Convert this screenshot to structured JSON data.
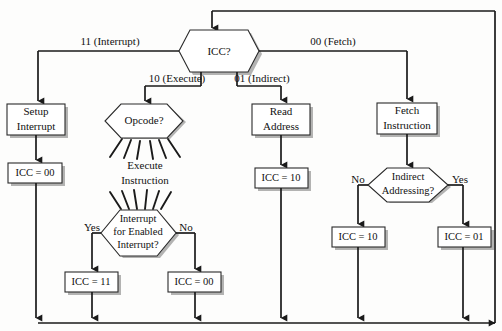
{
  "diagram": {
    "type": "flowchart"
  },
  "decisions": {
    "icc": {
      "label": "ICC?",
      "cx": 212,
      "cy": 51
    },
    "opcode": {
      "label": "Opcode?",
      "cx": 145,
      "cy": 122
    },
    "interrupt_check": {
      "line1": "Interrupt",
      "line2": "for Enabled",
      "line3": "Interrupt?",
      "cx": 140,
      "cy": 232
    },
    "indirect_check": {
      "line1": "Indirect",
      "line2": "Addressing?",
      "cx": 407,
      "cy": 184
    }
  },
  "processes": {
    "setup_interrupt": {
      "line1": "Setup",
      "line2": "Interrupt"
    },
    "read_address": {
      "line1": "Read",
      "line2": "Address"
    },
    "fetch_instruction": {
      "line1": "Fetch",
      "line2": "Instruction"
    },
    "execute_instruction": {
      "line1": "Execute",
      "line2": "Instruction"
    }
  },
  "states": {
    "icc_00_interrupt_branch": "ICC = 00",
    "icc_10_indirect_branch": "ICC = 10",
    "icc_11_execute_yes": "ICC = 11",
    "icc_00_execute_no": "ICC = 00",
    "icc_10_fetch_no": "ICC = 10",
    "icc_01_fetch_yes": "ICC = 01"
  },
  "edge_labels": {
    "interrupt": "11 (Interrupt)",
    "execute": "10 (Execute)",
    "indirect": "01 (Indirect)",
    "fetch": "00 (Fetch)",
    "yes_execute": "Yes",
    "no_execute": "No",
    "no_indirect": "No",
    "yes_indirect": "Yes"
  },
  "colors": {
    "line": "#1a1a1a",
    "shape_stroke": "#2a2a2a",
    "shape_fill": "#ffffff",
    "shadow": "#9a9a9a",
    "background": "#fdfdfc"
  }
}
